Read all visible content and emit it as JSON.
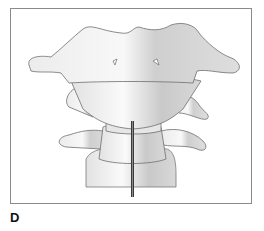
{
  "figure": {
    "panel_label": "D",
    "colors": {
      "border": "#8a8a8a",
      "bone_light": "#f4f4f4",
      "bone_shadow": "#bdbdbd",
      "outline": "#6e6e6e",
      "needle": "#3a3a3a"
    }
  }
}
